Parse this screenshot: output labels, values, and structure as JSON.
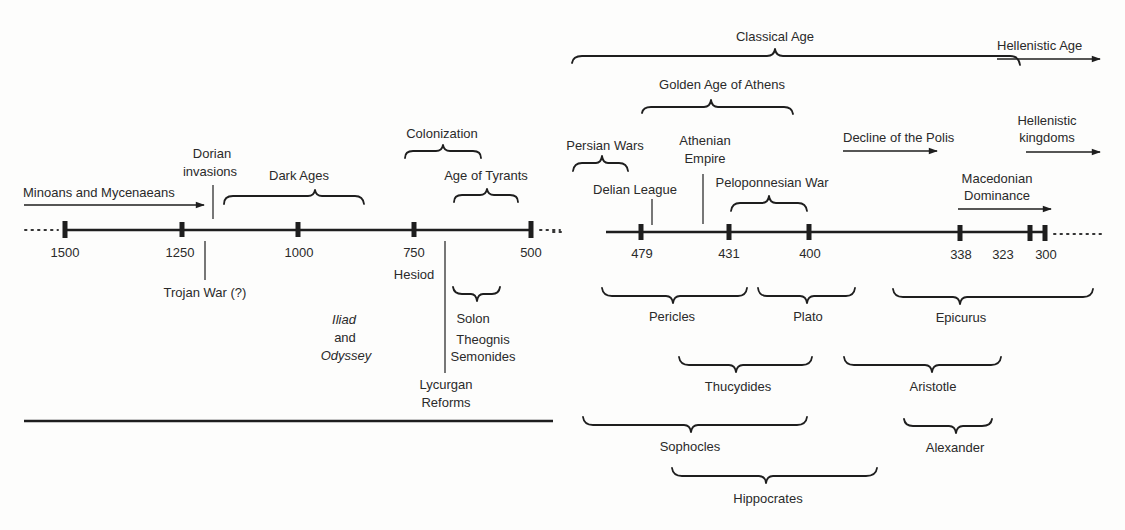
{
  "timeline_left": {
    "ticks": [
      {
        "label": "1500",
        "x": 65
      },
      {
        "label": "1250",
        "x": 182
      },
      {
        "label": "1000",
        "x": 298
      },
      {
        "label": "750",
        "x": 414
      },
      {
        "label": "500",
        "x": 531
      }
    ],
    "events_above": {
      "minoans": "Minoans and Mycenaeans",
      "dorian_1": "Dorian",
      "dorian_2": "invasions",
      "dark_ages": "Dark Ages",
      "colonization": "Colonization",
      "age_of_tyrants": "Age of Tyrants"
    },
    "events_below": {
      "trojan_war": "Trojan War (?)",
      "hesiod": "Hesiod",
      "iliad": "Iliad",
      "and": "and",
      "odyssey": "Odyssey",
      "solon": "Solon",
      "theognis": "Theognis",
      "semonides": "Semonides",
      "lycurgan_1": "Lycurgan",
      "lycurgan_2": "Reforms"
    }
  },
  "timeline_right": {
    "ticks": [
      {
        "label": "479",
        "x": 641
      },
      {
        "label": "431",
        "x": 728
      },
      {
        "label": "400",
        "x": 809
      },
      {
        "label": "338",
        "x": 960
      },
      {
        "label": "323",
        "x": 1030
      },
      {
        "label": "300",
        "x": 1045
      }
    ],
    "periods_above": {
      "classical_age": "Classical Age",
      "hellenistic_age": "Hellenistic Age",
      "golden_age": "Golden Age of Athens",
      "persian_wars": "Persian Wars",
      "athenian_1": "Athenian",
      "athenian_2": "Empire",
      "delian_league": "Delian League",
      "peloponnesian_war": "Peloponnesian War",
      "decline_polis": "Decline of the Polis",
      "hellenistic_k1": "Hellenistic",
      "hellenistic_k2": "kingdoms",
      "macedonian_1": "Macedonian",
      "macedonian_2": "Dominance"
    },
    "people_below": {
      "pericles": "Pericles",
      "plato": "Plato",
      "epicurus": "Epicurus",
      "thucydides": "Thucydides",
      "aristotle": "Aristotle",
      "sophocles": "Sophocles",
      "alexander": "Alexander",
      "hippocrates": "Hippocrates"
    }
  }
}
